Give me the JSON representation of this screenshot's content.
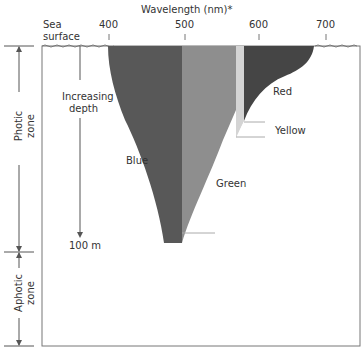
{
  "title": "Wavelength (nm)*",
  "sea_surface": [
    "Sea",
    "surface"
  ],
  "ticks": [
    "400",
    "500",
    "600",
    "700"
  ],
  "depth_label": [
    "Increasing",
    "depth"
  ],
  "depth_value": "100 m",
  "zones": {
    "photic": [
      "Photic",
      "zone"
    ],
    "aphotic": [
      "Aphotic",
      "zone"
    ]
  },
  "bands": {
    "blue": "Blue",
    "green": "Green",
    "yellow": "Yellow",
    "red": "Red"
  },
  "colors": {
    "blue": "#585858",
    "green": "#8e8e8e",
    "yellow": "#d4d4d4",
    "red": "#454545",
    "line": "#666666"
  }
}
